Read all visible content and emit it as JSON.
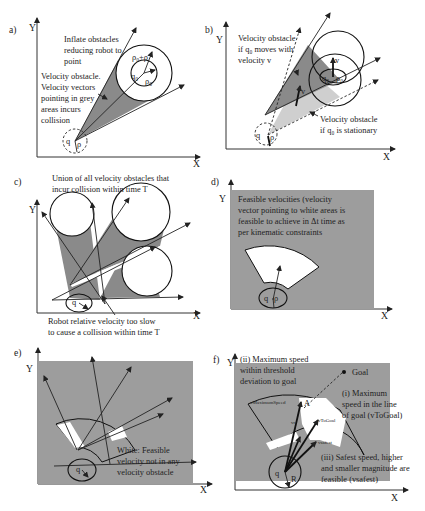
{
  "figure": {
    "panels": [
      {
        "id": "a",
        "label": "a)",
        "axis_y": "Y",
        "axis_x": "X",
        "annotations": {
          "inflate": [
            "Inflate obstacles",
            "reducing robot to",
            "point"
          ],
          "vo": [
            "Velocity obstacle.",
            "Velocity vectors",
            "pointing in grey",
            "areas incurs",
            "collision"
          ],
          "rho_sum": "ρ₀+ρ",
          "rho0": "ρ₀",
          "q0": "q₀",
          "q": "q",
          "rho": "ρ"
        }
      },
      {
        "id": "b",
        "label": "b)",
        "axis_y": "Y",
        "axis_x": "X",
        "annotations": {
          "moving": [
            "Velocity obstacle",
            "if q₀ moves with",
            "velocity v"
          ],
          "stationary": [
            "Velocity obstacle",
            "if q₀ is stationary"
          ],
          "v": "v",
          "q0": "q₀",
          "rho0": "ρ₀",
          "q": "q",
          "rho": "ρ"
        }
      },
      {
        "id": "c",
        "label": "c)",
        "axis_y": "Y",
        "axis_x": "X",
        "annotations": {
          "union": [
            "Union of all velocity obstacles that",
            "incur collision within time T"
          ],
          "slow": [
            "Robot relative velocity too slow",
            "to cause a collision within time T"
          ],
          "q": "q"
        }
      },
      {
        "id": "d",
        "label": "d)",
        "axis_y": "Y",
        "axis_x": "X",
        "annotations": {
          "feasible": [
            "Feasible velocities (velocity",
            "vector pointing to white areas is",
            "feasible to achieve in Δt time as",
            "per kinematic constraints"
          ],
          "q": "q",
          "rho": "ρ"
        }
      },
      {
        "id": "e",
        "label": "e)",
        "axis_y": "Y",
        "axis_x": "X",
        "annotations": {
          "white": [
            "White: Feasible",
            "velocity not in any",
            "velocity obstacle"
          ],
          "q": "q"
        }
      },
      {
        "id": "f",
        "label": "f)",
        "axis_y": "Y",
        "axis_x": "X",
        "annotations": {
          "max_threshold": [
            "(ii) Maximum speed",
            "within threshold",
            "deviation to goal"
          ],
          "goal": "Goal",
          "max_line": [
            "(i) Maximum",
            "speed in the line",
            "of goal (vToGoal)"
          ],
          "safest": [
            "(iii) Safest speed, higher",
            "and smaller magnitude are",
            "feasible (vsafest)"
          ],
          "v_max": "vMaximumSpeed",
          "v_togoal": "vToGoal",
          "v_safest": "vsafest",
          "v_r": "vr",
          "A": "A",
          "q": "q",
          "R": "R"
        }
      }
    ],
    "colors": {
      "obstacle_grey": "#8a8a8a",
      "panel_grey": "#9d9d9d",
      "light_grey": "#cfcfcf",
      "white": "#ffffff",
      "line": "#222222"
    }
  }
}
